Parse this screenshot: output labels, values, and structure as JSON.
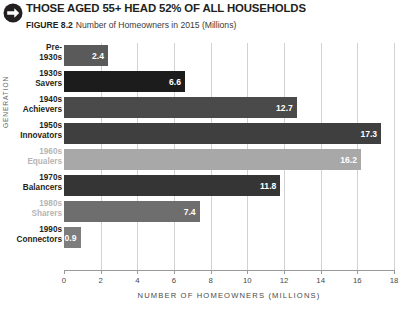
{
  "header": {
    "icon": "arrow-right-circle-icon",
    "title": "THOSE AGED 55+ HEAD 52% OF ALL HOUSEHOLDS",
    "figure_label": "FIGURE 8.2",
    "subtitle": "Number of Homeowners in 2015 (Millions)"
  },
  "source_note": "",
  "chart_data": {
    "type": "bar",
    "orientation": "horizontal",
    "title": "THOSE AGED 55+ HEAD 52% OF ALL HOUSEHOLDS",
    "subtitle": "Number of Homeowners in 2015 (Millions)",
    "xlabel": "NUMBER OF HOMEOWNERS (MILLIONS)",
    "ylabel": "GENERATION",
    "xlim": [
      0,
      18
    ],
    "xticks": [
      0,
      2,
      4,
      6,
      8,
      10,
      12,
      14,
      16,
      18
    ],
    "grid": "vertical",
    "legend": "none",
    "categories": [
      {
        "line1": "Pre-",
        "line2": "1930s",
        "muted": false
      },
      {
        "line1": "1930s",
        "line2": "Savers",
        "muted": false
      },
      {
        "line1": "1940s",
        "line2": "Achievers",
        "muted": false
      },
      {
        "line1": "1950s",
        "line2": "Innovators",
        "muted": false
      },
      {
        "line1": "1960s",
        "line2": "Equalers",
        "muted": true
      },
      {
        "line1": "1970s",
        "line2": "Balancers",
        "muted": false
      },
      {
        "line1": "1980s",
        "line2": "Sharers",
        "muted": true
      },
      {
        "line1": "1990s",
        "line2": "Connectors",
        "muted": false
      }
    ],
    "values": [
      2.4,
      6.6,
      12.7,
      17.3,
      16.2,
      11.8,
      7.4,
      0.9
    ],
    "value_labels": [
      "2.4",
      "6.6",
      "12.7",
      "17.3",
      "16.2",
      "11.8",
      "7.4",
      "0.9"
    ],
    "bar_colors": [
      "#5a5a5a",
      "#1c1c1c",
      "#4a4a4a",
      "#3f3f3f",
      "#a8a8a8",
      "#353535",
      "#6e6e6e",
      "#7d7d7d"
    ],
    "grid_color": "#d2d2d2",
    "axis_color": "#9a9a9a",
    "value_label_color": "#ffffff"
  }
}
